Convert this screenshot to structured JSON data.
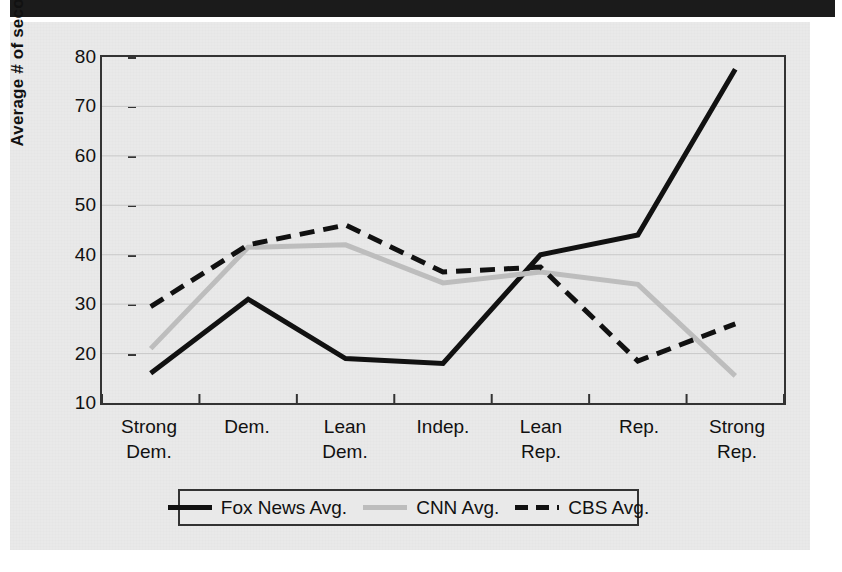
{
  "page": {
    "top_bar_present": true,
    "background_color": "#e9e9e9"
  },
  "chart_data": {
    "type": "line",
    "title": "",
    "xlabel": "",
    "ylabel": "Average # of seconds",
    "categories": [
      "Strong Dem.",
      "Dem.",
      "Lean Dem.",
      "Indep.",
      "Lean Rep.",
      "Rep.",
      "Strong Rep."
    ],
    "category_lines": [
      [
        "Strong",
        "Dem."
      ],
      [
        "Dem.",
        ""
      ],
      [
        "Lean",
        "Dem."
      ],
      [
        "Indep.",
        ""
      ],
      [
        "Lean",
        "Rep."
      ],
      [
        "Rep.",
        ""
      ],
      [
        "Strong",
        "Rep."
      ]
    ],
    "ylim": [
      10,
      80
    ],
    "yticks": [
      10,
      20,
      30,
      40,
      50,
      60,
      70,
      80
    ],
    "grid": true,
    "legend_position": "bottom",
    "series": [
      {
        "name": "Fox News Avg.",
        "style": "solid",
        "color": "#111111",
        "width": 5,
        "values": [
          16,
          31,
          19,
          18,
          40,
          44,
          77.5
        ]
      },
      {
        "name": "CNN Avg.",
        "style": "solid",
        "color": "#bdbdbd",
        "width": 5,
        "values": [
          21,
          41.5,
          42,
          34.3,
          36.5,
          34,
          15.5
        ]
      },
      {
        "name": "CBS Avg.",
        "style": "dashed",
        "color": "#111111",
        "width": 5,
        "values": [
          29.5,
          42,
          46,
          36.5,
          37.5,
          18.5,
          26
        ]
      }
    ]
  },
  "legend": {
    "items": [
      {
        "label": "Fox News Avg.",
        "swatch": "solid-black"
      },
      {
        "label": "CNN Avg.",
        "swatch": "solid-gray"
      },
      {
        "label": "CBS Avg.",
        "swatch": "dashed-black"
      }
    ]
  }
}
